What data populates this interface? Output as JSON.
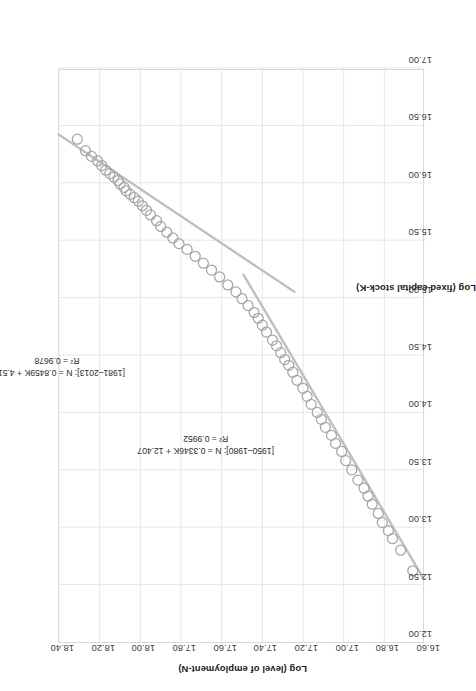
{
  "chart_data": {
    "type": "scatter",
    "title": "",
    "xlabel": "Log (fixed capital stock-K)",
    "ylabel": "Log (level of employment-N)",
    "xlim": [
      12.0,
      17.0
    ],
    "ylim": [
      16.6,
      18.4
    ],
    "xticks": [
      "12.00",
      "12.50",
      "13.00",
      "13.50",
      "14.00",
      "14.50",
      "15.00",
      "15.50",
      "16.00",
      "16.50",
      "17.00"
    ],
    "yticks": [
      "16.60",
      "16.80",
      "17.00",
      "17.20",
      "17.40",
      "17.60",
      "17.80",
      "18.00",
      "18.20",
      "18.40"
    ],
    "grid": true,
    "legend": "none",
    "marker": {
      "style": "open-circle",
      "color": "#a6a6a6",
      "size": 5
    },
    "trendline_color": "#bfbfbf",
    "series": [
      {
        "name": "1950-2013 observations",
        "x": [
          12.62,
          12.8,
          12.9,
          12.97,
          13.04,
          13.12,
          13.2,
          13.27,
          13.34,
          13.41,
          13.5,
          13.58,
          13.66,
          13.73,
          13.8,
          13.87,
          13.94,
          14.0,
          14.07,
          14.14,
          14.21,
          14.28,
          14.35,
          14.41,
          14.46,
          14.52,
          14.58,
          14.63,
          14.7,
          14.76,
          14.82,
          14.87,
          14.93,
          14.99,
          15.05,
          15.11,
          15.18,
          15.24,
          15.3,
          15.36,
          15.42,
          15.47,
          15.52,
          15.57,
          15.62,
          15.67,
          15.72,
          15.76,
          15.8,
          15.84,
          15.87,
          15.9,
          15.93,
          15.96,
          15.99,
          16.02,
          16.05,
          16.08,
          16.11,
          16.15,
          16.19,
          16.23,
          16.28,
          16.38
        ],
        "y": [
          16.66,
          16.72,
          16.76,
          16.78,
          16.81,
          16.83,
          16.86,
          16.88,
          16.9,
          16.93,
          16.96,
          16.99,
          17.01,
          17.04,
          17.06,
          17.09,
          17.11,
          17.13,
          17.16,
          17.18,
          17.2,
          17.23,
          17.25,
          17.27,
          17.29,
          17.31,
          17.33,
          17.35,
          17.38,
          17.4,
          17.42,
          17.44,
          17.47,
          17.5,
          17.53,
          17.57,
          17.61,
          17.65,
          17.69,
          17.73,
          17.77,
          17.81,
          17.84,
          17.87,
          17.9,
          17.92,
          17.95,
          17.97,
          17.99,
          18.01,
          18.03,
          18.05,
          18.07,
          18.08,
          18.1,
          18.11,
          18.13,
          18.15,
          18.17,
          18.19,
          18.21,
          18.24,
          18.27,
          18.31
        ]
      }
    ],
    "fits": [
      {
        "name": "1950-1980 fit",
        "slope": 0.3346,
        "intercept": 12.407,
        "r2": 0.9952,
        "x_from": 12.55,
        "x_to": 15.2,
        "label_line1": "[1950–1980]: N = 0.3346K + 12.407",
        "label_line2": "R² = 0.9952"
      },
      {
        "name": "1981-2013 fit",
        "slope": 0.8459,
        "intercept": 4.5116,
        "r2": 0.9678,
        "x_from": 15.05,
        "x_to": 16.42,
        "label_line1": "[1981–2013]: N = 0.8459K + 4.5116",
        "label_line2": "R² = 0.9678"
      }
    ]
  },
  "axes": {
    "x_title": "Log (fixed capital stock-K)",
    "y_title": "Log (level of employment-N)"
  },
  "annotations": {
    "upper": {
      "line1": "[1981–2013]: N = 0.8459K + 4.5116",
      "line2": "R² = 0.9678"
    },
    "lower": {
      "line1": "[1950–1980]: N = 0.3346K + 12.407",
      "line2": "R² = 0.9952"
    }
  }
}
